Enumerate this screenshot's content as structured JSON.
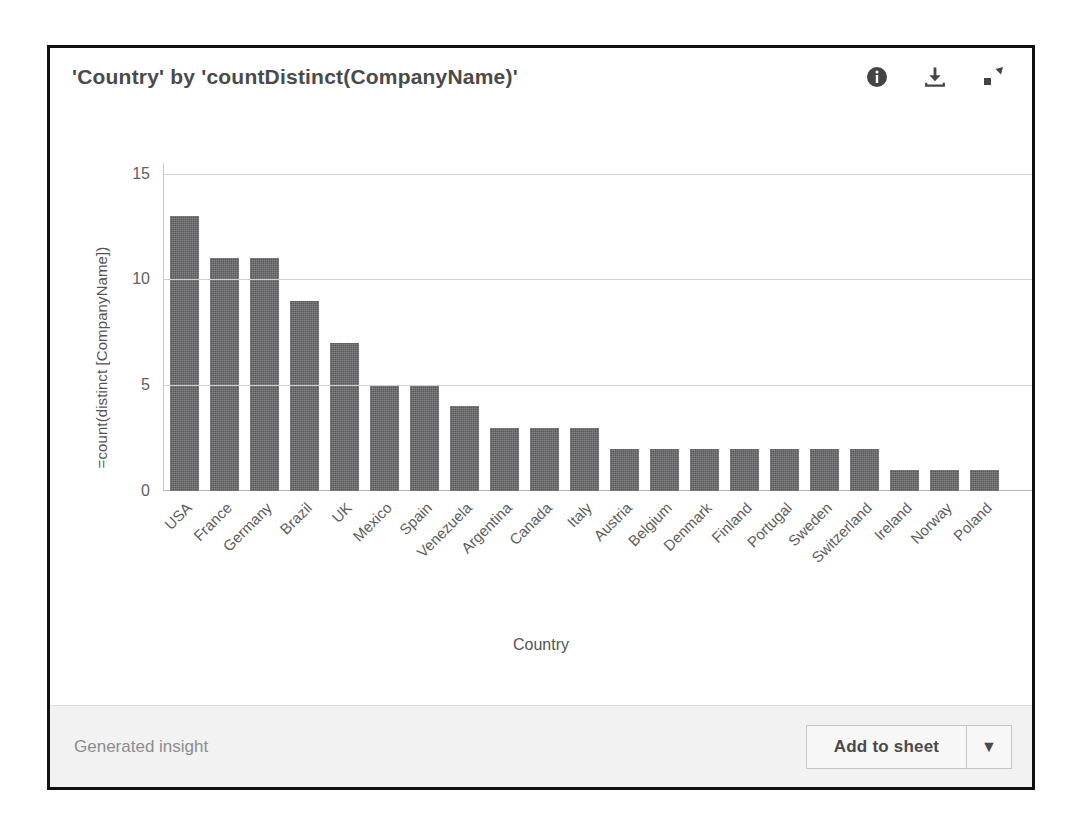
{
  "panel": {
    "title": "'Country' by 'countDistinct(CompanyName)'",
    "header_icons": [
      {
        "name": "info-icon",
        "glyph": "info"
      },
      {
        "name": "download-icon",
        "glyph": "download"
      },
      {
        "name": "expand-icon",
        "glyph": "expand"
      }
    ]
  },
  "footer": {
    "note": "Generated insight",
    "add_to_sheet_label": "Add to sheet",
    "dropdown_glyph": "▼"
  },
  "colors": {
    "bar": "#59595c",
    "panel_border": "#111111",
    "footer_background": "#f2f2f2",
    "gridline": "#cfcfcf",
    "title_text": "#4a4a4a",
    "axis_text": "#5d5d5d",
    "muted_text": "#8c8c8c"
  },
  "chart_data": {
    "type": "bar",
    "title": "'Country' by 'countDistinct(CompanyName)'",
    "xlabel": "Country",
    "ylabel": "=count(distinct [CompanyName])",
    "ylim": [
      0,
      15.5
    ],
    "yticks": [
      0,
      5,
      10,
      15
    ],
    "grid": true,
    "legend": "none",
    "orientation": "vertical",
    "categories": [
      "USA",
      "France",
      "Germany",
      "Brazil",
      "UK",
      "Mexico",
      "Spain",
      "Venezuela",
      "Argentina",
      "Canada",
      "Italy",
      "Austria",
      "Belgium",
      "Denmark",
      "Finland",
      "Portugal",
      "Sweden",
      "Switzerland",
      "Ireland",
      "Norway",
      "Poland"
    ],
    "values": [
      13,
      11,
      11,
      9,
      7,
      5,
      5,
      4,
      3,
      3,
      3,
      2,
      2,
      2,
      2,
      2,
      2,
      2,
      1,
      1,
      1
    ]
  }
}
